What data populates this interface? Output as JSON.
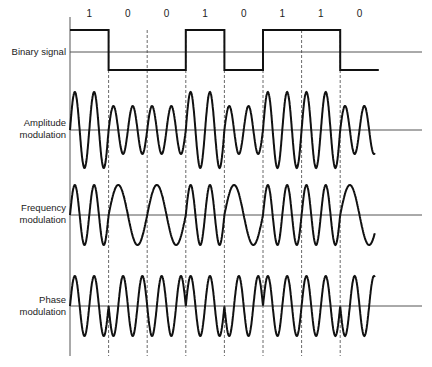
{
  "bits": [
    "1",
    "0",
    "0",
    "1",
    "0",
    "1",
    "1",
    "0"
  ],
  "rows": [
    {
      "id": "binary",
      "label_lines": [
        "Binary signal"
      ],
      "baseline_y": 52
    },
    {
      "id": "amplitude",
      "label_lines": [
        "Amplitude",
        "modulation"
      ],
      "baseline_y": 130
    },
    {
      "id": "frequency",
      "label_lines": [
        "Frequency",
        "modulation"
      ],
      "baseline_y": 215
    },
    {
      "id": "phase",
      "label_lines": [
        "Phase",
        "modulation"
      ],
      "baseline_y": 306
    }
  ],
  "colors": {
    "ink": "#111111",
    "line": "#555555",
    "dash": "#444444"
  }
}
